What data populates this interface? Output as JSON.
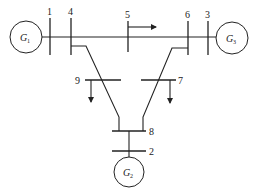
{
  "diagram": {
    "bus_labels": {
      "b1": "1",
      "b2": "2",
      "b3": "3",
      "b4": "4",
      "b5": "5",
      "b6": "6",
      "b7": "7",
      "b8": "8",
      "b9": "9"
    },
    "generators": [
      {
        "id": "G1",
        "letter": "G",
        "sub": "1",
        "bus": "1"
      },
      {
        "id": "G2",
        "letter": "G",
        "sub": "2",
        "bus": "2"
      },
      {
        "id": "G3",
        "letter": "G",
        "sub": "3",
        "bus": "3"
      }
    ],
    "loads": [
      {
        "bus": "5",
        "direction": "right"
      },
      {
        "bus": "9",
        "direction": "down"
      },
      {
        "bus": "7",
        "direction": "down"
      }
    ],
    "colors": {
      "line": "#222222",
      "background": "#ffffff"
    }
  }
}
